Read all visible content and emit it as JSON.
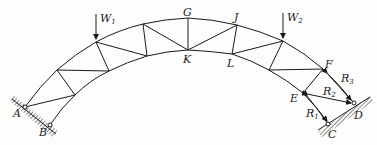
{
  "diagram": {
    "type": "arched truss with supports and reactions",
    "nodes": {
      "A": "A",
      "B": "B",
      "C": "C",
      "D": "D",
      "E": "E",
      "F": "F",
      "G": "G",
      "J": "J",
      "K": "K",
      "L": "L"
    },
    "loads": {
      "W1": {
        "base": "W",
        "sub": "1"
      },
      "W2": {
        "base": "W",
        "sub": "2"
      }
    },
    "reactions": {
      "R1": {
        "base": "R",
        "sub": "1"
      },
      "R2": {
        "base": "R",
        "sub": "2"
      },
      "R3": {
        "base": "R",
        "sub": "3"
      }
    },
    "line_color": "#1a1a1a"
  }
}
